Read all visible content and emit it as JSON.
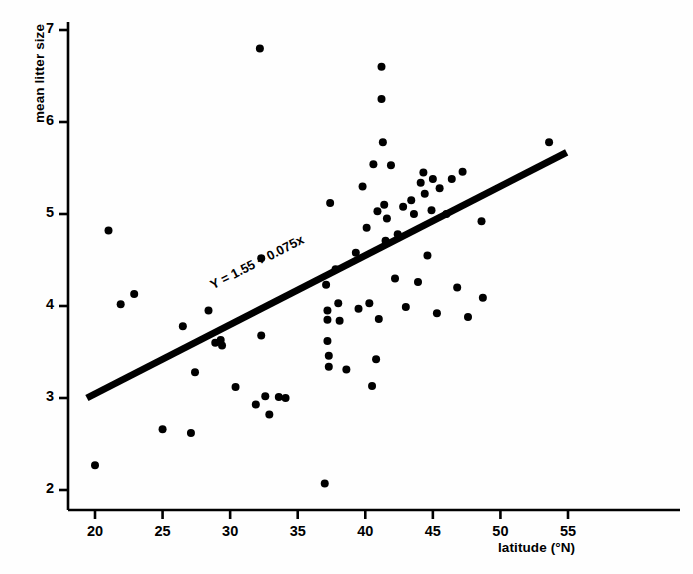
{
  "chart_data": {
    "type": "scatter",
    "title": "",
    "xlabel": "latitude (°N)",
    "ylabel": "mean litter size",
    "xlim": [
      19.0,
      55.8
    ],
    "ylim": [
      1.72,
      7.2
    ],
    "xticks": [
      20,
      25,
      30,
      35,
      40,
      45,
      50,
      55
    ],
    "yticks": [
      2,
      3,
      4,
      5,
      6,
      7
    ],
    "xtick_labels": [
      "20",
      "25",
      "30",
      "35",
      "40",
      "45",
      "50",
      "55"
    ],
    "ytick_labels": [
      "2",
      "3",
      "4",
      "5",
      "6",
      "7"
    ],
    "grid": false,
    "legend": null,
    "annotation": "Y = 1.55 + 0.075x",
    "annotation_x": 33.0,
    "annotation_y": 4.22,
    "fit_line": {
      "label": "Y = 1.55 + 0.075x",
      "intercept": 1.55,
      "slope": 0.075,
      "x_start": 19.4,
      "x_end": 54.9,
      "y_start": 3.0,
      "y_end": 5.67,
      "color": "#000000",
      "width_px": 7
    },
    "marker": {
      "shape": "circle",
      "color": "#000000",
      "size_px": 8
    },
    "points": [
      [
        20.0,
        2.27
      ],
      [
        21.0,
        4.82
      ],
      [
        21.9,
        4.02
      ],
      [
        22.9,
        4.13
      ],
      [
        25.0,
        2.66
      ],
      [
        26.5,
        3.78
      ],
      [
        27.1,
        2.62
      ],
      [
        27.4,
        3.28
      ],
      [
        28.4,
        3.95
      ],
      [
        28.9,
        3.6
      ],
      [
        29.3,
        3.63
      ],
      [
        29.4,
        3.57
      ],
      [
        30.4,
        3.12
      ],
      [
        31.9,
        2.93
      ],
      [
        32.2,
        6.8
      ],
      [
        32.3,
        4.52
      ],
      [
        32.3,
        3.68
      ],
      [
        32.6,
        3.02
      ],
      [
        32.9,
        2.82
      ],
      [
        33.6,
        3.01
      ],
      [
        34.1,
        3.0
      ],
      [
        37.0,
        2.07
      ],
      [
        37.1,
        4.23
      ],
      [
        37.2,
        3.95
      ],
      [
        37.2,
        3.85
      ],
      [
        37.2,
        3.62
      ],
      [
        37.3,
        3.46
      ],
      [
        37.3,
        3.34
      ],
      [
        37.4,
        5.12
      ],
      [
        37.8,
        4.4
      ],
      [
        38.0,
        4.03
      ],
      [
        38.1,
        3.84
      ],
      [
        38.6,
        3.31
      ],
      [
        39.3,
        4.58
      ],
      [
        39.5,
        3.97
      ],
      [
        39.8,
        5.3
      ],
      [
        40.1,
        4.85
      ],
      [
        40.3,
        4.03
      ],
      [
        40.5,
        3.13
      ],
      [
        40.6,
        5.54
      ],
      [
        40.8,
        3.42
      ],
      [
        40.9,
        5.03
      ],
      [
        41.0,
        3.86
      ],
      [
        41.2,
        6.6
      ],
      [
        41.2,
        6.25
      ],
      [
        41.3,
        5.78
      ],
      [
        41.4,
        5.1
      ],
      [
        41.5,
        4.71
      ],
      [
        41.6,
        4.95
      ],
      [
        41.9,
        5.53
      ],
      [
        42.2,
        4.3
      ],
      [
        42.4,
        4.78
      ],
      [
        42.8,
        5.08
      ],
      [
        43.0,
        3.99
      ],
      [
        43.4,
        5.15
      ],
      [
        43.6,
        5.0
      ],
      [
        43.9,
        4.26
      ],
      [
        44.1,
        5.34
      ],
      [
        44.3,
        5.45
      ],
      [
        44.4,
        5.22
      ],
      [
        44.6,
        4.55
      ],
      [
        44.9,
        5.04
      ],
      [
        45.0,
        5.38
      ],
      [
        45.3,
        3.92
      ],
      [
        45.5,
        5.28
      ],
      [
        46.0,
        5.0
      ],
      [
        46.4,
        5.38
      ],
      [
        46.8,
        4.2
      ],
      [
        47.2,
        5.46
      ],
      [
        47.6,
        3.88
      ],
      [
        48.6,
        4.92
      ],
      [
        48.7,
        4.09
      ],
      [
        53.6,
        5.78
      ]
    ]
  }
}
